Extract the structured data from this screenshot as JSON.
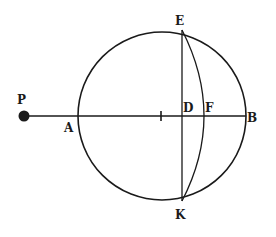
{
  "diagram": {
    "type": "geometric-figure",
    "stroke_color": "#1a1a1a",
    "background": "#ffffff",
    "circle": {
      "cx": 162,
      "cy": 116,
      "r": 84
    },
    "point_P": {
      "cx": 25,
      "cy": 116,
      "r": 5
    },
    "labels": {
      "P": "P",
      "A": "A",
      "B": "B",
      "D": "D",
      "F": "F",
      "E": "E",
      "K": "K"
    }
  }
}
